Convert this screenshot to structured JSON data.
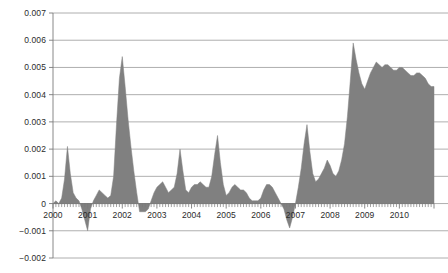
{
  "chart_data": {
    "type": "area",
    "title": "",
    "subtitle": "",
    "xlabel": "",
    "ylabel": "",
    "grid": true,
    "legend": false,
    "legend_position": "none",
    "series_color": "#808080",
    "gridline_color": "#9a9a9a",
    "axis_color": "#7a7a7a",
    "ylim": [
      -0.002,
      0.007
    ],
    "ytick_values": [
      0.007,
      0.006,
      0.005,
      0.004,
      0.003,
      0.002,
      0.001,
      0,
      -0.001,
      -0.002
    ],
    "ytick_labels": [
      "0.007",
      "0.006",
      "0.005",
      "0.004",
      "0.003",
      "0.002",
      "0.001",
      "0",
      "−0.001",
      "−0.002"
    ],
    "xlim": [
      2000.0,
      2011.0
    ],
    "xtick_labels": [
      "2000",
      "2001",
      "2002",
      "2003",
      "2004",
      "2005",
      "2006",
      "2007",
      "2008",
      "2009",
      "2010"
    ],
    "xtick_values": [
      2000,
      2001,
      2002,
      2003,
      2004,
      2005,
      2006,
      2007,
      2008,
      2009,
      2010
    ],
    "minor_tick_interval": 0.0833,
    "x": [
      2000.0,
      2000.083,
      2000.167,
      2000.25,
      2000.333,
      2000.417,
      2000.5,
      2000.583,
      2000.667,
      2000.75,
      2000.833,
      2000.917,
      2001.0,
      2001.083,
      2001.167,
      2001.25,
      2001.333,
      2001.417,
      2001.5,
      2001.583,
      2001.667,
      2001.75,
      2001.833,
      2001.917,
      2002.0,
      2002.083,
      2002.167,
      2002.25,
      2002.333,
      2002.417,
      2002.5,
      2002.583,
      2002.667,
      2002.75,
      2002.833,
      2002.917,
      2003.0,
      2003.083,
      2003.167,
      2003.25,
      2003.333,
      2003.417,
      2003.5,
      2003.583,
      2003.667,
      2003.75,
      2003.833,
      2003.917,
      2004.0,
      2004.083,
      2004.167,
      2004.25,
      2004.333,
      2004.417,
      2004.5,
      2004.583,
      2004.667,
      2004.75,
      2004.833,
      2004.917,
      2005.0,
      2005.083,
      2005.167,
      2005.25,
      2005.333,
      2005.417,
      2005.5,
      2005.583,
      2005.667,
      2005.75,
      2005.833,
      2005.917,
      2006.0,
      2006.083,
      2006.167,
      2006.25,
      2006.333,
      2006.417,
      2006.5,
      2006.583,
      2006.667,
      2006.75,
      2006.833,
      2006.917,
      2007.0,
      2007.083,
      2007.167,
      2007.25,
      2007.333,
      2007.417,
      2007.5,
      2007.583,
      2007.667,
      2007.75,
      2007.833,
      2007.917,
      2008.0,
      2008.083,
      2008.167,
      2008.25,
      2008.333,
      2008.417,
      2008.5,
      2008.583,
      2008.667,
      2008.75,
      2008.833,
      2008.917,
      2009.0,
      2009.083,
      2009.167,
      2009.25,
      2009.333,
      2009.417,
      2009.5,
      2009.583,
      2009.667,
      2009.75,
      2009.833,
      2009.917,
      2010.0,
      2010.083,
      2010.167,
      2010.25,
      2010.333,
      2010.417,
      2010.5,
      2010.583,
      2010.667,
      2010.75,
      2010.833,
      2010.917
    ],
    "values": [
      0.0,
      0.0001,
      0.0,
      0.0002,
      0.0009,
      0.0021,
      0.0011,
      0.0004,
      0.0002,
      0.0001,
      -0.0002,
      -0.0006,
      -0.001,
      -0.0002,
      0.0001,
      0.0003,
      0.0005,
      0.0004,
      0.0003,
      0.0002,
      0.0003,
      0.001,
      0.0029,
      0.0046,
      0.0054,
      0.0043,
      0.0031,
      0.0021,
      0.0012,
      0.0004,
      -0.0003,
      -0.0003,
      -0.0003,
      -0.0002,
      0.0001,
      0.0004,
      0.0006,
      0.0007,
      0.0008,
      0.0006,
      0.0004,
      0.0005,
      0.0006,
      0.0011,
      0.002,
      0.0012,
      0.0005,
      0.0004,
      0.0006,
      0.0007,
      0.0007,
      0.0008,
      0.0007,
      0.0006,
      0.0006,
      0.001,
      0.0018,
      0.0025,
      0.0015,
      0.0007,
      0.0003,
      0.0004,
      0.0006,
      0.0007,
      0.0006,
      0.0005,
      0.0005,
      0.0004,
      0.0002,
      0.0001,
      0.0001,
      0.0001,
      0.0002,
      0.0005,
      0.0007,
      0.0007,
      0.0006,
      0.0004,
      0.0002,
      0.0,
      -0.0002,
      -0.0006,
      -0.0009,
      -0.0005,
      0.0,
      0.0006,
      0.0013,
      0.0022,
      0.0029,
      0.0019,
      0.0011,
      0.0008,
      0.0009,
      0.0011,
      0.0013,
      0.0016,
      0.0014,
      0.0011,
      0.001,
      0.0012,
      0.0016,
      0.0022,
      0.0032,
      0.0045,
      0.0059,
      0.0053,
      0.0048,
      0.0044,
      0.0042,
      0.0045,
      0.0048,
      0.005,
      0.0052,
      0.0051,
      0.005,
      0.0051,
      0.0051,
      0.005,
      0.0049,
      0.0049,
      0.005,
      0.005,
      0.0049,
      0.0048,
      0.0047,
      0.0047,
      0.0048,
      0.0048,
      0.0047,
      0.0046,
      0.0044,
      0.0043
    ]
  }
}
